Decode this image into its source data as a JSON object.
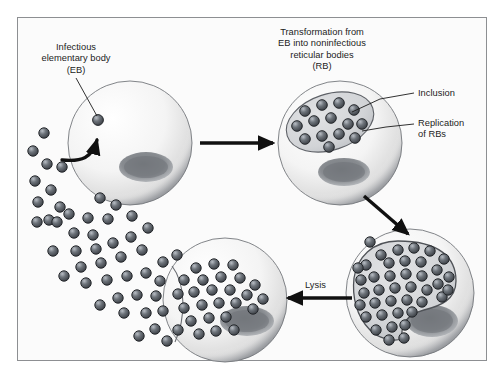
{
  "figure": {
    "title_text": "",
    "background_color": "#fbfbfb",
    "frame_border_color": "#8d8f92",
    "ink_color": "#1b1b1b"
  },
  "labels": {
    "elementary_body": "Infectious\nelementary body\n(EB)",
    "transformation": "Transformation from\nEB into noninfectious\nreticular bodies\n(RB)",
    "inclusion": "Inclusion",
    "replication": "Replication\nof RBs",
    "lysis": "Lysis"
  },
  "cells": [
    {
      "name": "host-cell-infection",
      "stage": "EB attachment and entry",
      "cx": 130,
      "cy": 143,
      "r": 62,
      "nucleus": {
        "cx": 146,
        "cy": 167,
        "rx": 27,
        "ry": 15
      },
      "inclusion": null,
      "particle_count": 1
    },
    {
      "name": "host-cell-inclusion",
      "stage": "RB replication inside inclusion",
      "cx": 340,
      "cy": 143,
      "r": 62,
      "nucleus": {
        "cx": 344,
        "cy": 172,
        "rx": 26,
        "ry": 14
      },
      "inclusion": {
        "cx": 330,
        "cy": 122,
        "rx": 45,
        "ry": 28,
        "rotation": -18
      },
      "particle_count": 14
    },
    {
      "name": "host-cell-packed",
      "stage": "Inclusion filled with progeny",
      "cx": 410,
      "cy": 293,
      "r": 64,
      "nucleus": {
        "cx": 432,
        "cy": 321,
        "rx": 26,
        "ry": 16
      },
      "inclusion": {
        "shape": "crescent"
      },
      "particle_count": 47
    },
    {
      "name": "host-cell-lysing",
      "stage": "Lysis and release of EBs",
      "cx": 225,
      "cy": 300,
      "r": 62,
      "nucleus": {
        "cx": 247,
        "cy": 321,
        "rx": 27,
        "ry": 15
      },
      "inclusion": null,
      "particle_count": 30
    }
  ],
  "arrows": [
    {
      "name": "arrow-infection-to-inclusion",
      "direction": "right",
      "from": [
        200,
        143
      ],
      "to": [
        273,
        143
      ]
    },
    {
      "name": "arrow-inclusion-to-packed",
      "direction": "down-right",
      "from": [
        366,
        198
      ],
      "to": [
        410,
        232
      ]
    },
    {
      "name": "arrow-packed-to-lysing",
      "direction": "left",
      "from": [
        350,
        298
      ],
      "to": [
        288,
        298
      ]
    },
    {
      "name": "arrow-eb-entry",
      "direction": "curved-up",
      "from": [
        74,
        163
      ],
      "to": [
        101,
        135
      ]
    }
  ],
  "particles": {
    "fill_dark": "#5b6066",
    "fill_mid": "#7b8088",
    "outline": "#2b2d31",
    "highlight": "#c9ced4",
    "radius": 5.2
  },
  "leader_lines": [
    {
      "name": "leader-eb",
      "from": [
        76,
        78
      ],
      "to": [
        98,
        120
      ]
    },
    {
      "name": "leader-inclusion",
      "from": [
        414,
        93
      ],
      "to": [
        352,
        112
      ]
    },
    {
      "name": "leader-replication",
      "from": [
        414,
        124
      ],
      "to": [
        358,
        131
      ]
    }
  ]
}
